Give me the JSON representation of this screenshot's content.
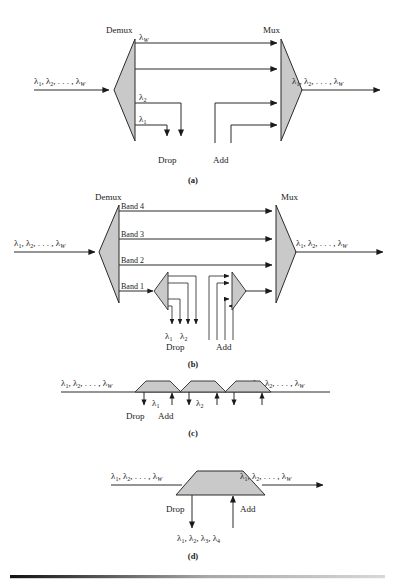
{
  "figure": {
    "title_visible": false,
    "colors": {
      "prism_fill": "#c9c9c9",
      "line": "#2b2b2b",
      "text": "#1a1a1a",
      "rule_dark": "#111111",
      "rule_light": "#9a9a9a"
    },
    "panels": [
      {
        "id": "a",
        "caption": "(a)",
        "demux_label": "Demux",
        "mux_label": "Mux",
        "input_label": "λ1, λ2, . . . , λW",
        "output_label": "λ1, λ2, . . . , λW",
        "channel_labels": [
          "λW",
          "λ2",
          "λ1"
        ],
        "drop_label": "Drop",
        "add_label": "Add",
        "num_channels": 4,
        "num_dropped": 2,
        "num_added": 2
      },
      {
        "id": "b",
        "caption": "(b)",
        "demux_label": "Demux",
        "mux_label": "Mux",
        "input_label": "λ1, λ2, . . . , λW",
        "output_label": "λ1, λ2, . . . , λW",
        "band_labels": [
          "Band 4",
          "Band 3",
          "Band 2",
          "Band 1"
        ],
        "drop_label": "Drop",
        "add_label": "Add",
        "drop_wavelengths": [
          "λ1",
          "λ2"
        ],
        "num_bands": 4,
        "num_band1_channels": 4
      },
      {
        "id": "c",
        "caption": "(c)",
        "input_label": "λ1, λ2, . . . , λW",
        "output_label": "λ1, λ2, . . . , λW",
        "drop_label": "Drop",
        "add_label": "Add",
        "node_wavelengths": [
          "λ1",
          "λ2",
          ""
        ],
        "num_nodes": 3
      },
      {
        "id": "d",
        "caption": "(d)",
        "input_label": "λ1, λ2, . . . , λW",
        "output_label": "λ1, λ2, . . . , λW",
        "drop_label": "Drop",
        "add_label": "Add",
        "drop_wavelengths_label": "λ1, λ2, λ3, λ4"
      }
    ]
  }
}
